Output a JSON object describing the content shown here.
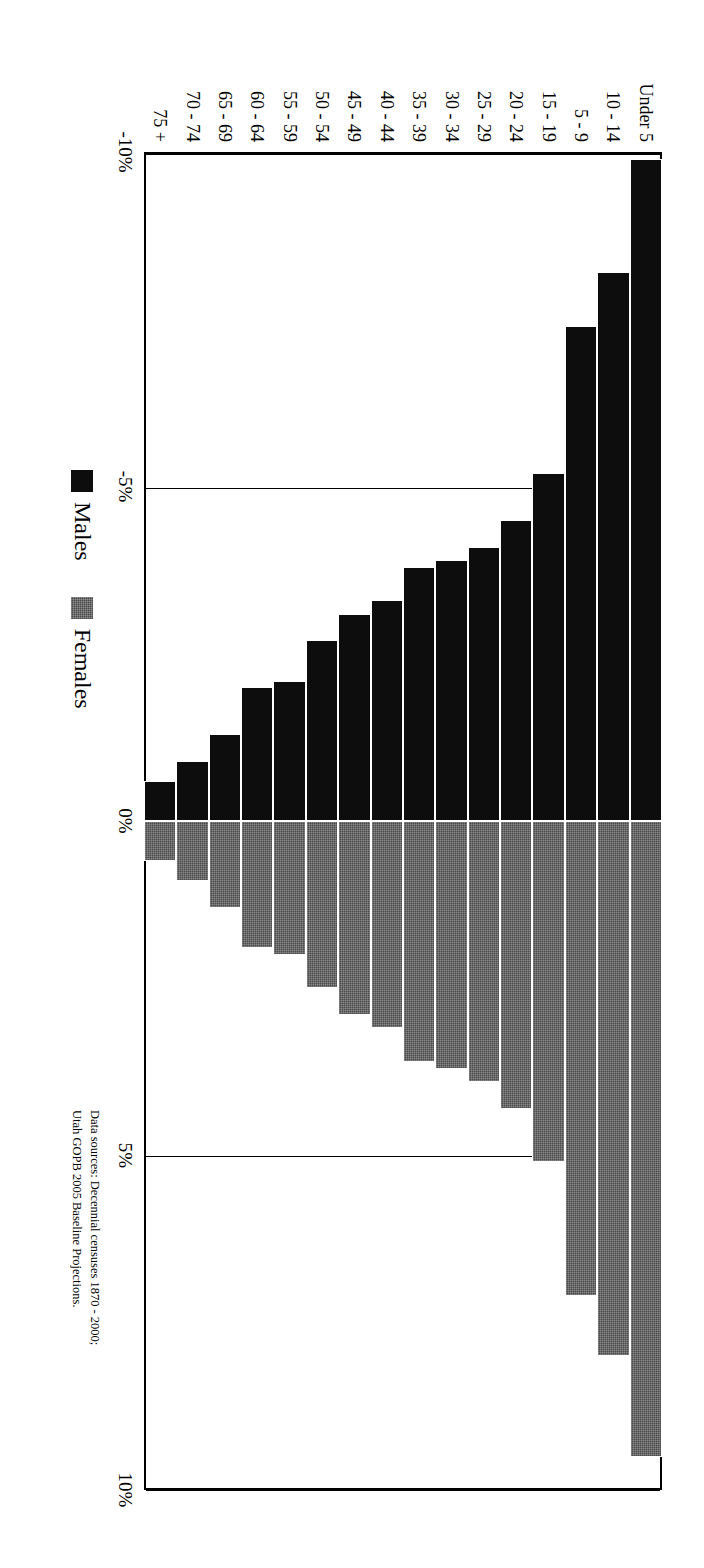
{
  "chart_data": {
    "type": "bar",
    "subtype": "population-pyramid",
    "title": "",
    "xlabel": "",
    "ylabel": "",
    "orientation": "horizontal-diverging",
    "rotation_note": "figure rendered rotated 90 degrees on the page",
    "grid": true,
    "xlim": [
      -10,
      10
    ],
    "xticks": [
      -10,
      -5,
      0,
      5,
      10
    ],
    "xtick_labels": [
      "-10%",
      "-5%",
      "0%",
      "5%",
      "10%"
    ],
    "categories": [
      "Under 5",
      "10 - 14",
      "5 - 9",
      "15 - 19",
      "20 - 24",
      "25 - 29",
      "30 - 34",
      "35 - 39",
      "40 - 44",
      "45 - 49",
      "50 - 54",
      "55 - 59",
      "60 - 64",
      "65 - 69",
      "70 - 74",
      "75 +"
    ],
    "legend": [
      "Males",
      "Females"
    ],
    "legend_position": "below-left",
    "series": [
      {
        "name": "Males",
        "color": "#0d0d0d",
        "sign": "negative",
        "values": [
          -9.9,
          -8.2,
          -7.4,
          -5.2,
          -4.5,
          -4.1,
          -3.9,
          -3.8,
          -3.3,
          -3.1,
          -2.7,
          -2.1,
          -2.0,
          -1.3,
          -0.9,
          -0.6
        ]
      },
      {
        "name": "Females",
        "color": "#4a4a4a",
        "sign": "positive",
        "values": [
          9.5,
          8.0,
          7.1,
          5.1,
          4.3,
          3.9,
          3.7,
          3.6,
          3.1,
          2.9,
          2.5,
          2.0,
          1.9,
          1.3,
          0.9,
          0.6
        ]
      }
    ]
  },
  "legend": {
    "males_label": "Males",
    "females_label": "Females",
    "males_color": "#0d0d0d",
    "females_color": "#4a4a4a"
  },
  "source": {
    "line1": "Data sources: Decennial censuses 1870 - 2000;",
    "line2": "Utah GOPB 2005 Baseline Projections."
  }
}
